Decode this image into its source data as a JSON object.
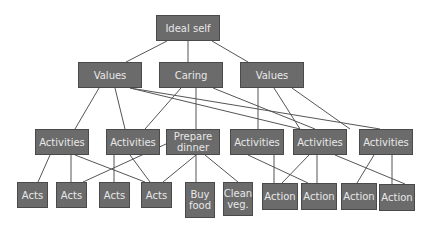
{
  "colors": {
    "node_fill": "#6b6b6b",
    "node_border": "#4a4a4a",
    "node_text": "#e8e8e8",
    "edge": "#555555"
  },
  "nodes": [
    {
      "id": "ideal",
      "label": "Ideal self",
      "x": 156,
      "y": 15,
      "w": 64,
      "h": 26
    },
    {
      "id": "v1",
      "label": "Values",
      "x": 78,
      "y": 62,
      "w": 64,
      "h": 26
    },
    {
      "id": "caring",
      "label": "Caring",
      "x": 159,
      "y": 62,
      "w": 64,
      "h": 26
    },
    {
      "id": "v2",
      "label": "Values",
      "x": 240,
      "y": 62,
      "w": 64,
      "h": 26
    },
    {
      "id": "a1",
      "label": "Activities",
      "x": 35,
      "y": 129,
      "w": 54,
      "h": 26
    },
    {
      "id": "a2",
      "label": "Activities",
      "x": 106,
      "y": 129,
      "w": 54,
      "h": 26
    },
    {
      "id": "prep",
      "label": "Prepare\ndinner",
      "x": 166,
      "y": 129,
      "w": 54,
      "h": 26
    },
    {
      "id": "a3",
      "label": "Activities",
      "x": 230,
      "y": 129,
      "w": 54,
      "h": 26
    },
    {
      "id": "a4",
      "label": "Activities",
      "x": 293,
      "y": 129,
      "w": 54,
      "h": 26
    },
    {
      "id": "a5",
      "label": "Activities",
      "x": 359,
      "y": 129,
      "w": 54,
      "h": 26
    },
    {
      "id": "acts1",
      "label": "Acts",
      "x": 17,
      "y": 182,
      "w": 31,
      "h": 26
    },
    {
      "id": "acts2",
      "label": "Acts",
      "x": 56,
      "y": 182,
      "w": 31,
      "h": 26
    },
    {
      "id": "acts3",
      "label": "Acts",
      "x": 99,
      "y": 182,
      "w": 31,
      "h": 26
    },
    {
      "id": "acts4",
      "label": "Acts",
      "x": 141,
      "y": 182,
      "w": 31,
      "h": 26
    },
    {
      "id": "buy",
      "label": "Buy\nfood",
      "x": 185,
      "y": 182,
      "w": 30,
      "h": 36
    },
    {
      "id": "clean",
      "label": "Clean\nveg.",
      "x": 223,
      "y": 182,
      "w": 30,
      "h": 34
    },
    {
      "id": "act1",
      "label": "Action",
      "x": 262,
      "y": 183,
      "w": 36,
      "h": 27
    },
    {
      "id": "act2",
      "label": "Action",
      "x": 301,
      "y": 183,
      "w": 36,
      "h": 27
    },
    {
      "id": "act3",
      "label": "Action",
      "x": 341,
      "y": 183,
      "w": 36,
      "h": 27
    },
    {
      "id": "act4",
      "label": "Action",
      "x": 379,
      "y": 184,
      "w": 36,
      "h": 27
    }
  ],
  "edges": [
    [
      167,
      41,
      126,
      62
    ],
    [
      188,
      41,
      188,
      62
    ],
    [
      212,
      41,
      248,
      62
    ],
    [
      99,
      88,
      75,
      129
    ],
    [
      115,
      88,
      125,
      129
    ],
    [
      130,
      88,
      300,
      129
    ],
    [
      130,
      88,
      380,
      129
    ],
    [
      181,
      88,
      145,
      129
    ],
    [
      196,
      88,
      196,
      129
    ],
    [
      213,
      88,
      315,
      129
    ],
    [
      258,
      88,
      258,
      129
    ],
    [
      274,
      88,
      300,
      129
    ],
    [
      292,
      88,
      350,
      129
    ],
    [
      50,
      155,
      38,
      182
    ],
    [
      71,
      155,
      71,
      182
    ],
    [
      75,
      155,
      145,
      182
    ],
    [
      114,
      155,
      114,
      182
    ],
    [
      130,
      155,
      150,
      182
    ],
    [
      166,
      144,
      83,
      182
    ],
    [
      196,
      155,
      163,
      182
    ],
    [
      196,
      155,
      196,
      182
    ],
    [
      205,
      155,
      238,
      182
    ],
    [
      248,
      155,
      308,
      183
    ],
    [
      274,
      155,
      274,
      183
    ],
    [
      309,
      155,
      282,
      183
    ],
    [
      317,
      155,
      317,
      183
    ],
    [
      335,
      155,
      405,
      184
    ],
    [
      374,
      155,
      357,
      183
    ],
    [
      392,
      155,
      392,
      184
    ]
  ]
}
